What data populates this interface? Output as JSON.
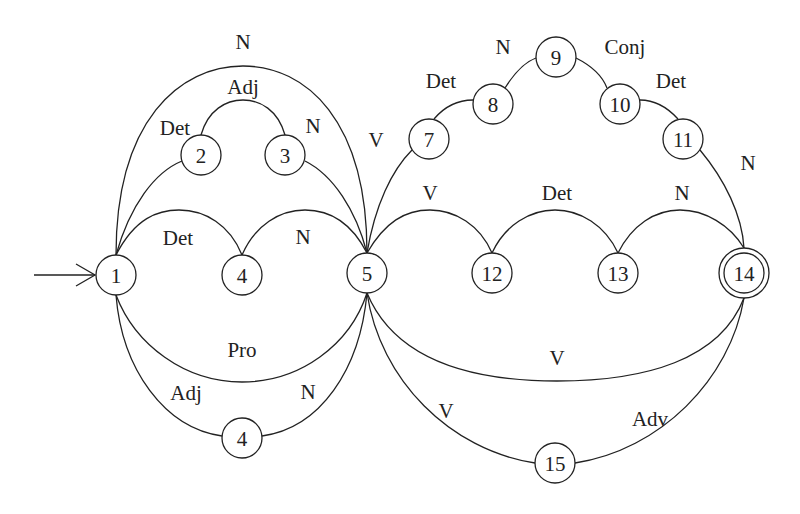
{
  "diagram": {
    "type": "finite-state-automaton",
    "start_state": "1",
    "final_states": [
      "14"
    ],
    "nodes": [
      {
        "id": "n1",
        "label": "1",
        "x": 116,
        "y": 275
      },
      {
        "id": "n2",
        "label": "2",
        "x": 201,
        "y": 155
      },
      {
        "id": "n3",
        "label": "3",
        "x": 285,
        "y": 155
      },
      {
        "id": "n4a",
        "label": "4",
        "x": 242,
        "y": 275
      },
      {
        "id": "n5",
        "label": "5",
        "x": 367,
        "y": 273
      },
      {
        "id": "n4b",
        "label": "4",
        "x": 242,
        "y": 438
      },
      {
        "id": "n7",
        "label": "7",
        "x": 429,
        "y": 139
      },
      {
        "id": "n8",
        "label": "8",
        "x": 493,
        "y": 104
      },
      {
        "id": "n9",
        "label": "9",
        "x": 556,
        "y": 57
      },
      {
        "id": "n10",
        "label": "10",
        "x": 620,
        "y": 104
      },
      {
        "id": "n11",
        "label": "11",
        "x": 683,
        "y": 139
      },
      {
        "id": "n12",
        "label": "12",
        "x": 492,
        "y": 273
      },
      {
        "id": "n13",
        "label": "13",
        "x": 618,
        "y": 273
      },
      {
        "id": "n14",
        "label": "14",
        "x": 744,
        "y": 273,
        "final": true
      },
      {
        "id": "n15",
        "label": "15",
        "x": 555,
        "y": 463
      }
    ],
    "edges": [
      {
        "from": "1",
        "to": "5",
        "label": "N",
        "route": "outer-top"
      },
      {
        "from": "1",
        "to": "2",
        "label": "Det"
      },
      {
        "from": "2",
        "to": "3",
        "label": "Adj"
      },
      {
        "from": "3",
        "to": "5",
        "label": "N"
      },
      {
        "from": "1",
        "to": "4",
        "label": "Det"
      },
      {
        "from": "4",
        "to": "5",
        "label": "N"
      },
      {
        "from": "1",
        "to": "5",
        "label": "Pro",
        "route": "lower"
      },
      {
        "from": "1",
        "to": "4",
        "label": "Adj",
        "route": "bottom"
      },
      {
        "from": "4",
        "to": "5",
        "label": "N",
        "route": "bottom"
      },
      {
        "from": "5",
        "to": "7",
        "label": "V"
      },
      {
        "from": "7",
        "to": "8",
        "label": "Det"
      },
      {
        "from": "8",
        "to": "9",
        "label": "N"
      },
      {
        "from": "9",
        "to": "10",
        "label": "Conj"
      },
      {
        "from": "10",
        "to": "11",
        "label": "Det"
      },
      {
        "from": "11",
        "to": "14",
        "label": "N"
      },
      {
        "from": "5",
        "to": "12",
        "label": "V"
      },
      {
        "from": "12",
        "to": "13",
        "label": "Det"
      },
      {
        "from": "13",
        "to": "14",
        "label": "N"
      },
      {
        "from": "5",
        "to": "14",
        "label": "V",
        "route": "lower"
      },
      {
        "from": "5",
        "to": "15",
        "label": "V"
      },
      {
        "from": "15",
        "to": "14",
        "label": "Adv"
      }
    ]
  },
  "nodes": {
    "n1": "1",
    "n2": "2",
    "n3": "3",
    "n4a": "4",
    "n5": "5",
    "n4b": "4",
    "n7": "7",
    "n8": "8",
    "n9": "9",
    "n10": "10",
    "n11": "11",
    "n12": "12",
    "n13": "13",
    "n14": "14",
    "n15": "15"
  },
  "labels": {
    "top_n": "N",
    "adj_2_3": "Adj",
    "det_1_2": "Det",
    "n_3_5": "N",
    "det_1_4": "Det",
    "n_4_5": "N",
    "pro_1_5": "Pro",
    "adj_1_4b": "Adj",
    "n_4b_5": "N",
    "v_5_7": "V",
    "det_7_8": "Det",
    "n_8_9": "N",
    "conj_9_10": "Conj",
    "det_10_11": "Det",
    "n_11_14": "N",
    "v_5_12": "V",
    "det_12_13": "Det",
    "n_13_14": "N",
    "v_5_14": "V",
    "v_5_15": "V",
    "adv_15_14": "Adv"
  }
}
